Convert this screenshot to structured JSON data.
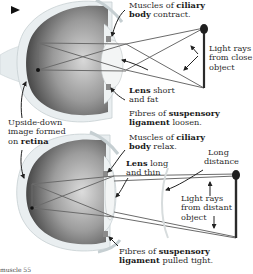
{
  "diagram": {
    "top_panel": {
      "labels": {
        "ciliary_contract": {
          "pre": "Muscles of ",
          "bold": "ciliary",
          "line2_bold": "body",
          "line2_post": " contract."
        },
        "light_close": [
          "Light rays",
          "from close",
          "object"
        ],
        "lens_short": {
          "bold": "Lens",
          "post": " short",
          "line2": "and fat"
        },
        "fibres_loosen": {
          "pre": "Fibres of ",
          "bold": "suspensory",
          "line2_bold": "ligament",
          "line2_post": " loosen."
        }
      }
    },
    "middle_label": {
      "line1": "Upside-down",
      "line2": "image formed",
      "line3_pre": "on ",
      "line3_bold": "retina"
    },
    "bottom_panel": {
      "labels": {
        "ciliary_relax": {
          "pre": "Muscles of ",
          "bold": "ciliary",
          "line2_bold": "body",
          "line2_post": " relax."
        },
        "lens_long": {
          "bold": "Lens",
          "post": " long",
          "line2": "and thin"
        },
        "long_distance": [
          "Long",
          "distance"
        ],
        "light_distant": [
          "Light rays",
          "from distant",
          "object"
        ],
        "fibres_tight": {
          "pre": "Fibres of ",
          "bold": "suspensory",
          "line2_bold": "ligament",
          "line2_post": " pulled tight."
        }
      }
    },
    "footer": "muscle 55",
    "colors": {
      "sclera": "#e9eef0",
      "eye_dark": "#4a4a4a",
      "lens": "#f4f6f6",
      "ray": "#6e6e6e",
      "object": "#2a2a2a",
      "muscle": "#8a8a8a"
    }
  }
}
